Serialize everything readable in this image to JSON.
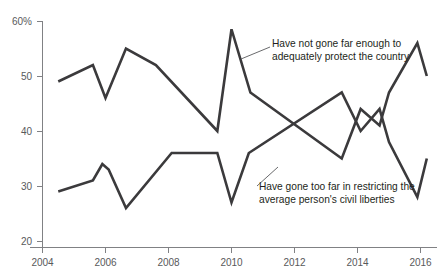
{
  "chart_data": {
    "type": "line",
    "title": "",
    "subtitle": "",
    "xlabel": "",
    "ylabel": "",
    "xlim": [
      2004,
      2016.2
    ],
    "ylim": [
      20,
      60
    ],
    "grid": false,
    "legend_position": "inline-annotations",
    "y_ticks": [
      "60%",
      "50",
      "40",
      "30",
      "20"
    ],
    "y_tick_values": [
      60,
      50,
      40,
      30,
      20
    ],
    "x_ticks": [
      "2004",
      "2006",
      "2008",
      "2010",
      "2012",
      "2014",
      "2016"
    ],
    "x_tick_values": [
      2004,
      2006,
      2008,
      2010,
      2012,
      2014,
      2016
    ],
    "series": [
      {
        "name": "Have not gone far enough to adequately protect the country",
        "color": "#3b3a3c",
        "x": [
          2004.5,
          2005.6,
          2006.0,
          2006.65,
          2007.6,
          2009.55,
          2010.0,
          2010.6,
          2013.5,
          2014.1,
          2014.7,
          2015.0,
          2015.9,
          2016.2
        ],
        "values": [
          49,
          52,
          46,
          55,
          52,
          40,
          58.5,
          47,
          35,
          44,
          41,
          47,
          56,
          50
        ]
      },
      {
        "name": "Have gone too far in restricting the average person's civil liberties",
        "color": "#3b3a3c",
        "x": [
          2004.5,
          2005.6,
          2005.9,
          2006.1,
          2006.65,
          2008.1,
          2009.55,
          2010.0,
          2010.55,
          2013.5,
          2014.1,
          2014.7,
          2015.0,
          2015.9,
          2016.2
        ],
        "values": [
          29,
          31,
          34,
          33,
          26,
          36,
          36,
          27,
          36,
          47,
          40,
          44,
          38,
          28,
          35
        ]
      }
    ],
    "annotations": [
      {
        "id": "upper-annotation",
        "text_line1": "Have not gone far enough to",
        "text_line2": "adequately protect the country",
        "text_x": 272,
        "text_y": 47,
        "leader_from_x": 270,
        "leader_from_y": 47,
        "leader_to_x": 241,
        "leader_to_y": 59
      },
      {
        "id": "lower-annotation",
        "text_line1": "Have gone too far in restricting the",
        "text_line2": "average person's civil liberties",
        "text_x": 259,
        "text_y": 190,
        "leader_from_x": 257,
        "leader_from_y": 186,
        "leader_to_x": 278,
        "leader_to_y": 167
      }
    ],
    "colors": {
      "line": "#3b3a3c",
      "axis": "#808184",
      "tick_text": "#58595b",
      "annotation_text": "#231f20",
      "background": "#ffffff"
    }
  }
}
